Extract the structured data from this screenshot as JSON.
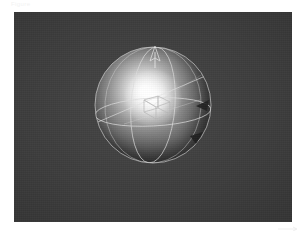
{
  "figure": {
    "caption": "Figure",
    "panel": {
      "background_color": "#3d3d3d",
      "width_px": 278,
      "height_px": 210
    }
  },
  "scene": {
    "title": "Shaded sphere with orientation gizmo",
    "renderer_background": "#3d3d3d",
    "objects": [
      {
        "name": "sphere",
        "type": "shaded-sphere",
        "center_px": [
          139,
          93
        ],
        "radius_px": 58,
        "material": "glossy-grey",
        "highlight_color": "#ffffff",
        "shadow_color": "#121212",
        "light_direction": "upper-left"
      },
      {
        "name": "equator",
        "type": "wireframe-circle",
        "color": "#d8d8d8",
        "label": "equator"
      },
      {
        "name": "meridian",
        "type": "wireframe-circle",
        "color": "#d8d8d8",
        "label": "meridian"
      },
      {
        "name": "tilted-great-circle",
        "type": "wireframe-circle",
        "color": "#d0d0d0",
        "label": "orbit path"
      },
      {
        "name": "center-cube",
        "type": "wireframe-box",
        "color": "#bdbdbd",
        "label": "bounding box"
      },
      {
        "name": "pole-arrow",
        "type": "axis-arrow",
        "color": "#e8e8e8",
        "direction": "up",
        "label": "north pole axis"
      },
      {
        "name": "normal-cone-upper",
        "type": "cone-marker",
        "color": "#1b1b1b",
        "label": "surface normal"
      },
      {
        "name": "normal-cone-lower",
        "type": "cone-marker",
        "color": "#1b1b1b",
        "label": "surface normal"
      }
    ]
  },
  "colors": {
    "page_background": "#ffffff",
    "panel_background": "#3d3d3d",
    "wire_stroke": "#d8d8d8",
    "highlight": "#ffffff",
    "terminator_shadow": "#121212"
  }
}
